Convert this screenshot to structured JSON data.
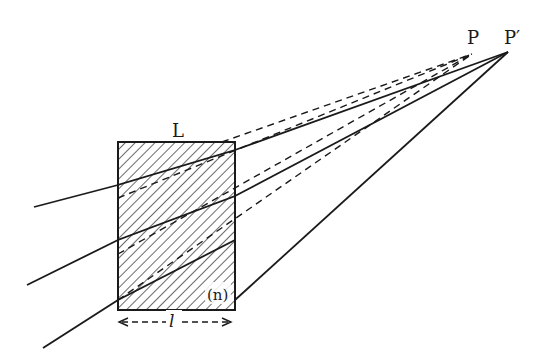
{
  "diagram": {
    "labels": {
      "slab": "L",
      "index": "(n)",
      "thickness": "l",
      "object_point": "P",
      "image_point": "P′"
    },
    "colors": {
      "ink": "#1a1a1a",
      "background": "#ffffff"
    },
    "slab": {
      "x": 118,
      "y": 142,
      "width": 117,
      "height": 168
    },
    "points": {
      "P": [
        472,
        54
      ],
      "P_prime": [
        508,
        52
      ]
    },
    "rays": [
      {
        "start": [
          34,
          207
        ],
        "enter": [
          118,
          185
        ],
        "exit": [
          235,
          150
        ],
        "end": [
          508,
          52
        ]
      },
      {
        "start": [
          27,
          285
        ],
        "enter": [
          118,
          240
        ],
        "exit": [
          235,
          196
        ],
        "end": [
          508,
          52
        ]
      },
      {
        "start": [
          43,
          348
        ],
        "enter": [
          118,
          300
        ],
        "exit": [
          235,
          240
        ],
        "end": [
          508,
          52
        ]
      }
    ]
  }
}
